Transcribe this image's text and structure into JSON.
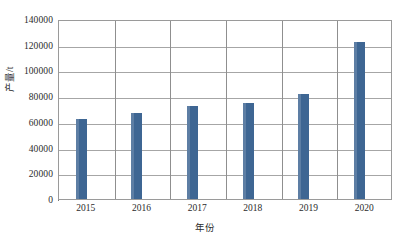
{
  "chart_data": {
    "type": "bar",
    "title": "",
    "xlabel": "年份",
    "ylabel": "产量/t",
    "categories": [
      "2015",
      "2016",
      "2017",
      "2018",
      "2019",
      "2020"
    ],
    "values": [
      62000,
      67000,
      72500,
      75000,
      82000,
      122000
    ],
    "series": [
      {
        "name": "产量/t",
        "values": [
          62000,
          67000,
          72500,
          75000,
          82000,
          122000
        ]
      }
    ],
    "ylim": [
      0,
      140000
    ],
    "yticks": [
      0,
      20000,
      40000,
      60000,
      80000,
      100000,
      120000,
      140000
    ],
    "ytick_labels": [
      "0",
      "20000",
      "40000",
      "60000",
      "80000",
      "100000",
      "120000",
      "140000"
    ],
    "grid": "horizontal-and-category-separators",
    "legend": "none",
    "bar_color": "#3e6693",
    "plot_border_color": "#9a9a9a",
    "gridline_color": "#a6a6a6"
  }
}
